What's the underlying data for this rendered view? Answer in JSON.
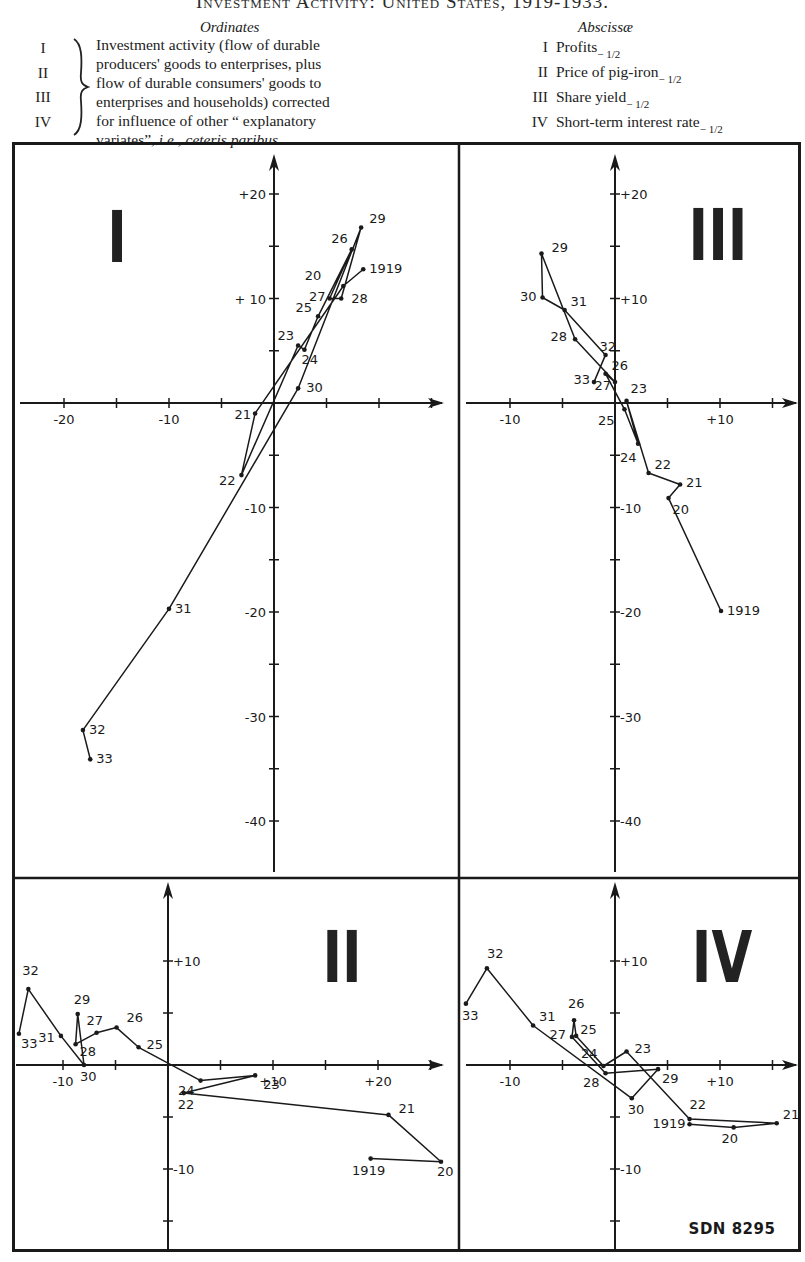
{
  "header": {
    "title": "Investment Activity: United States, 1919-1933.",
    "ordinates_heading": "Ordinates",
    "abscissae_heading": "Abscissæ",
    "ordinate_numerals": [
      "I",
      "II",
      "III",
      "IV"
    ],
    "ordinate_description_lines": [
      "Investment activity (flow of durable",
      "producers' goods to enterprises, plus",
      "flow of durable consumers' goods to",
      "enterprises and households) corrected",
      "for influence of other “ explanatory"
    ],
    "ordinate_description_last_plain": "variates”, ",
    "ordinate_description_last_italic": "i.e., ceteris paribus.",
    "abscissae": [
      {
        "numeral": "I",
        "label": "Profits",
        "lag": "− 1/2"
      },
      {
        "numeral": "II",
        "label": "Price of pig-iron",
        "lag": "− 1/2"
      },
      {
        "numeral": "III",
        "label": "Share yield",
        "lag": "− 1/2"
      },
      {
        "numeral": "IV",
        "label": "Short-term interest rate",
        "lag": "− 1/2"
      }
    ]
  },
  "footer": {
    "code": "SDN 8295"
  },
  "colors": {
    "ink": "#1a1a1a",
    "paper": "#ffffff"
  },
  "chart_data": [
    {
      "panel": "I",
      "type": "line",
      "title": "I",
      "xlabel": "Profits (lagged 1/2 year)",
      "ylabel": "Investment activity",
      "xticks": [
        -20,
        -15,
        -10,
        -5,
        0,
        5,
        10,
        15
      ],
      "xtick_labels": {
        "-20": "-20",
        "-10": "-10"
      },
      "yticks": [
        -40,
        -35,
        -30,
        -25,
        -20,
        -15,
        -10,
        -5,
        0,
        5,
        10,
        15,
        20
      ],
      "ytick_labels": {
        "20": "+20",
        "10": "+ 10",
        "-10": "-10",
        "-20": "-20",
        "-30": "-30",
        "-40": "-40"
      },
      "xlim": [
        -24.5,
        17
      ],
      "ylim": [
        -44,
        23.5
      ],
      "grid": false,
      "points": [
        {
          "label": "1919",
          "x": 8.5,
          "y": 12.8
        },
        {
          "label": "20",
          "x": 6.6,
          "y": 11.2
        },
        {
          "label": "21",
          "x": -1.8,
          "y": -1.0
        },
        {
          "label": "22",
          "x": -3.1,
          "y": -6.9
        },
        {
          "label": "23",
          "x": 2.3,
          "y": 5.5
        },
        {
          "label": "24",
          "x": 2.9,
          "y": 5.1
        },
        {
          "label": "25",
          "x": 4.2,
          "y": 8.3
        },
        {
          "label": "26",
          "x": 7.4,
          "y": 14.7
        },
        {
          "label": "27",
          "x": 5.3,
          "y": 10.0
        },
        {
          "label": "28",
          "x": 6.4,
          "y": 10.0
        },
        {
          "label": "29",
          "x": 8.3,
          "y": 16.8
        },
        {
          "label": "30",
          "x": 2.3,
          "y": 1.4
        },
        {
          "label": "31",
          "x": -10.0,
          "y": -19.7
        },
        {
          "label": "32",
          "x": -18.2,
          "y": -31.3
        },
        {
          "label": "33",
          "x": -17.5,
          "y": -34.1
        }
      ]
    },
    {
      "panel": "II",
      "type": "line",
      "title": "II",
      "xlabel": "Price of pig-iron (lagged 1/2 year)",
      "ylabel": "Investment activity",
      "xticks": [
        -15,
        -10,
        -5,
        0,
        5,
        10,
        15,
        20,
        25
      ],
      "xtick_labels": {
        "-10": "-10",
        "10": "+10",
        "20": "+20"
      },
      "yticks": [
        -15,
        -10,
        -5,
        0,
        5,
        10
      ],
      "ytick_labels": {
        "10": "+10",
        "-10": "-10"
      },
      "xlim": [
        -14.8,
        26.5
      ],
      "ylim": [
        -17.5,
        17.5
      ],
      "grid": false,
      "points": [
        {
          "label": "1919",
          "x": 19.3,
          "y": -9.0
        },
        {
          "label": "20",
          "x": 26.0,
          "y": -9.3
        },
        {
          "label": "21",
          "x": 21.0,
          "y": -4.8
        },
        {
          "label": "22",
          "x": 1.5,
          "y": -2.7
        },
        {
          "label": "23",
          "x": 8.3,
          "y": -1.0
        },
        {
          "label": "24",
          "x": 3.1,
          "y": -1.5
        },
        {
          "label": "25",
          "x": -2.8,
          "y": 1.7
        },
        {
          "label": "26",
          "x": -4.9,
          "y": 3.6
        },
        {
          "label": "27",
          "x": -6.8,
          "y": 3.1
        },
        {
          "label": "28",
          "x": -8.8,
          "y": 2.0
        },
        {
          "label": "29",
          "x": -8.6,
          "y": 4.9
        },
        {
          "label": "30",
          "x": -8.0,
          "y": 0.0
        },
        {
          "label": "31",
          "x": -10.2,
          "y": 2.8
        },
        {
          "label": "32",
          "x": -13.3,
          "y": 7.3
        },
        {
          "label": "33",
          "x": -14.2,
          "y": 3.0
        }
      ]
    },
    {
      "panel": "III",
      "type": "line",
      "title": "III",
      "xlabel": "Share yield (lagged 1/2 year)",
      "ylabel": "Investment activity",
      "xticks": [
        -10,
        -5,
        0,
        5,
        10,
        15
      ],
      "xtick_labels": {
        "-10": "-10",
        "10": "+10"
      },
      "yticks": [
        -40,
        -35,
        -30,
        -25,
        -20,
        -15,
        -10,
        -5,
        0,
        5,
        10,
        15,
        20
      ],
      "ytick_labels": {
        "20": "+20",
        "10": "+10",
        "-10": "-10",
        "-20": "-20",
        "-30": "-30",
        "-40": "-40"
      },
      "xlim": [
        -14.8,
        17.5
      ],
      "ylim": [
        -44,
        23.5
      ],
      "grid": false,
      "points": [
        {
          "label": "1919",
          "x": 10.1,
          "y": -19.9
        },
        {
          "label": "20",
          "x": 5.1,
          "y": -9.1
        },
        {
          "label": "21",
          "x": 6.2,
          "y": -7.8
        },
        {
          "label": "22",
          "x": 3.2,
          "y": -6.7
        },
        {
          "label": "23",
          "x": 1.1,
          "y": 0.2
        },
        {
          "label": "24",
          "x": 2.2,
          "y": -3.9
        },
        {
          "label": "25",
          "x": 0.9,
          "y": -0.6
        },
        {
          "label": "26",
          "x": -0.9,
          "y": 2.8
        },
        {
          "label": "27",
          "x": 0.0,
          "y": 2.0
        },
        {
          "label": "28",
          "x": -3.8,
          "y": 6.1
        },
        {
          "label": "29",
          "x": -7.0,
          "y": 14.3
        },
        {
          "label": "30",
          "x": -6.9,
          "y": 10.1
        },
        {
          "label": "31",
          "x": -4.8,
          "y": 8.9
        },
        {
          "label": "32",
          "x": -0.9,
          "y": 4.6
        },
        {
          "label": "33",
          "x": -2.0,
          "y": 2.0
        }
      ]
    },
    {
      "panel": "IV",
      "type": "line",
      "title": "IV",
      "xlabel": "Short-term interest rate (lagged 1/2 year)",
      "ylabel": "Investment activity",
      "xticks": [
        -10,
        -5,
        0,
        5,
        10,
        15
      ],
      "xtick_labels": {
        "-10": "-10",
        "10": "+10"
      },
      "yticks": [
        -15,
        -10,
        -5,
        0,
        5,
        10
      ],
      "ytick_labels": {
        "10": "+10",
        "-10": "-10"
      },
      "xlim": [
        -14.8,
        17.5
      ],
      "ylim": [
        -17.5,
        17.5
      ],
      "grid": false,
      "points": [
        {
          "label": "1919",
          "x": 7.1,
          "y": -5.7
        },
        {
          "label": "20",
          "x": 11.3,
          "y": -6.0
        },
        {
          "label": "21",
          "x": 15.4,
          "y": -5.6
        },
        {
          "label": "22",
          "x": 7.1,
          "y": -5.2
        },
        {
          "label": "23",
          "x": 1.1,
          "y": 1.3
        },
        {
          "label": "24",
          "x": -1.1,
          "y": -0.1
        },
        {
          "label": "25",
          "x": -3.7,
          "y": 2.8
        },
        {
          "label": "26",
          "x": -3.9,
          "y": 4.3
        },
        {
          "label": "27",
          "x": -4.1,
          "y": 2.7
        },
        {
          "label": "28",
          "x": -0.9,
          "y": -0.8
        },
        {
          "label": "29",
          "x": 4.1,
          "y": -0.4
        },
        {
          "label": "30",
          "x": 1.6,
          "y": -3.2
        },
        {
          "label": "31",
          "x": -7.8,
          "y": 3.8
        },
        {
          "label": "32",
          "x": -12.2,
          "y": 9.3
        },
        {
          "label": "33",
          "x": -14.2,
          "y": 5.9
        }
      ]
    }
  ]
}
